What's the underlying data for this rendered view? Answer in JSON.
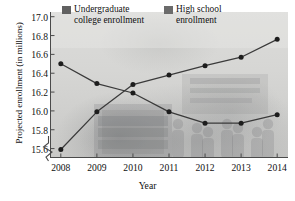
{
  "chart_data": {
    "type": "line",
    "title": "",
    "xlabel": "Year",
    "ylabel": "Projected enrollment (in millions)",
    "x": [
      2008,
      2009,
      2010,
      2011,
      2012,
      2013,
      2014
    ],
    "xtick_labels": [
      "2008",
      "2009",
      "2010",
      "2011",
      "2012",
      "2013",
      "2014"
    ],
    "ytick_labels": [
      "15.6",
      "15.8",
      "16.0",
      "16.2",
      "16.4",
      "16.6",
      "16.8",
      "17.0"
    ],
    "yticks": [
      15.6,
      15.8,
      16.0,
      16.2,
      16.4,
      16.6,
      16.8,
      17.0
    ],
    "ylim": [
      15.5,
      17.05
    ],
    "xlim": [
      2007.7,
      2014.3
    ],
    "grid": false,
    "axis_break": true,
    "legend_position": "top-center",
    "series": [
      {
        "name": "Undergraduate college enrollment",
        "color": "#5a5a5a",
        "marker": "circle",
        "values": [
          16.5,
          16.29,
          16.19,
          15.99,
          15.87,
          15.87,
          15.96
        ]
      },
      {
        "name": "High school enrollment",
        "color": "#5a5a5a",
        "marker": "circle",
        "values": [
          15.59,
          15.99,
          16.28,
          16.38,
          16.48,
          16.57,
          16.76
        ]
      }
    ]
  },
  "legend": {
    "items": [
      {
        "label": "Undergraduate college enrollment",
        "swatch_color": "#616161"
      },
      {
        "label": "High school enrollment",
        "swatch_color": "#6b6b6b"
      }
    ]
  },
  "axes": {
    "y_title": "Projected enrollment (in millions)",
    "x_title": "Year"
  },
  "style": {
    "line_color": "#3a3a3a",
    "marker_color": "#1d1d1d",
    "axis_color": "#4a4a4a",
    "plot_bg": "#d6d6d4",
    "page_bg": "#ffffff"
  }
}
